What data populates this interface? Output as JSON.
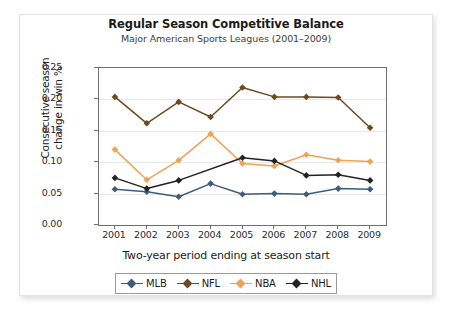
{
  "chart_data": {
    "type": "line",
    "title": "Regular Season Competitive Balance",
    "subtitle": "Major American Sports Leagues (2001–2009)",
    "xlabel": "Two-year period ending at season start",
    "ylabel_line1": "Consecutive season",
    "ylabel_line2": "change in win %",
    "categories": [
      "2001",
      "2002",
      "2003",
      "2004",
      "2005",
      "2006",
      "2007",
      "2008",
      "2009"
    ],
    "ylim": [
      0.0,
      0.25
    ],
    "yticks": [
      "0.00",
      "0.05",
      "0.10",
      "0.15",
      "0.20",
      "0.25"
    ],
    "ytick_values": [
      0.0,
      0.05,
      0.1,
      0.15,
      0.2,
      0.25
    ],
    "grid": "horizontal",
    "legend_position": "bottom",
    "series": [
      {
        "name": "MLB",
        "color": "#3f5c79",
        "values": [
          0.057,
          0.053,
          0.045,
          0.066,
          0.049,
          0.05,
          0.049,
          0.058,
          0.057
        ]
      },
      {
        "name": "NFL",
        "color": "#6b4a22",
        "values": [
          0.204,
          0.162,
          0.196,
          0.172,
          0.219,
          0.204,
          0.204,
          0.203,
          0.155
        ]
      },
      {
        "name": "NBA",
        "color": "#f0a254",
        "values": [
          0.12,
          0.072,
          0.103,
          0.145,
          0.098,
          0.094,
          0.112,
          0.103,
          0.101
        ]
      },
      {
        "name": "NHL",
        "color": "#232323",
        "values": [
          0.075,
          0.058,
          0.071,
          null,
          0.107,
          0.102,
          0.079,
          0.08,
          0.071
        ]
      }
    ]
  }
}
